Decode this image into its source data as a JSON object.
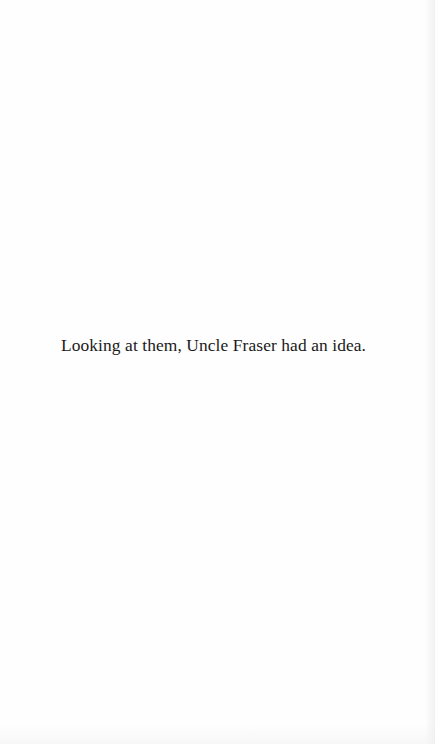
{
  "page": {
    "background": "#fefefe",
    "text_color": "#1a1a1a",
    "body_text": "Looking at them, Uncle Fraser had an idea."
  }
}
